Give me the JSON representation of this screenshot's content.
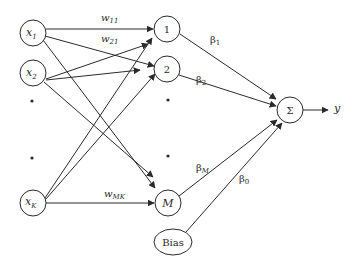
{
  "diagram": {
    "type": "neural-network",
    "stroke_color": "#2a2a2a",
    "background": "#ffffff",
    "input_nodes": [
      {
        "id": "x1",
        "label": "x",
        "sub": "1",
        "cx": 33,
        "cy": 33
      },
      {
        "id": "x2",
        "label": "x",
        "sub": "2",
        "cx": 33,
        "cy": 73
      },
      {
        "id": "xK",
        "label": "x",
        "sub": "K",
        "cx": 33,
        "cy": 203
      }
    ],
    "hidden_nodes": [
      {
        "id": "h1",
        "label": "1",
        "cx": 167,
        "cy": 29
      },
      {
        "id": "h2",
        "label": "2",
        "cx": 167,
        "cy": 69
      },
      {
        "id": "hM",
        "label": "M",
        "cx": 168,
        "cy": 203
      }
    ],
    "bias_node": {
      "label": "Bias",
      "cx": 173,
      "cy": 242
    },
    "sum_node": {
      "label": "Σ",
      "cx": 290,
      "cy": 110
    },
    "output": {
      "label": "y"
    },
    "weight_labels": [
      {
        "base": "w",
        "sub": "11"
      },
      {
        "base": "w",
        "sub": "21"
      },
      {
        "base": "w",
        "sub": "MK"
      }
    ],
    "beta_labels": [
      {
        "base": "β",
        "sub": "1"
      },
      {
        "base": "β",
        "sub": "2"
      },
      {
        "base": "β",
        "sub": "M"
      },
      {
        "base": "β",
        "sub": "0"
      }
    ],
    "ellipsis_dots": [
      {
        "x": 32,
        "y": 101
      },
      {
        "x": 32,
        "y": 158
      },
      {
        "x": 168,
        "y": 100
      },
      {
        "x": 168,
        "y": 156
      }
    ]
  }
}
